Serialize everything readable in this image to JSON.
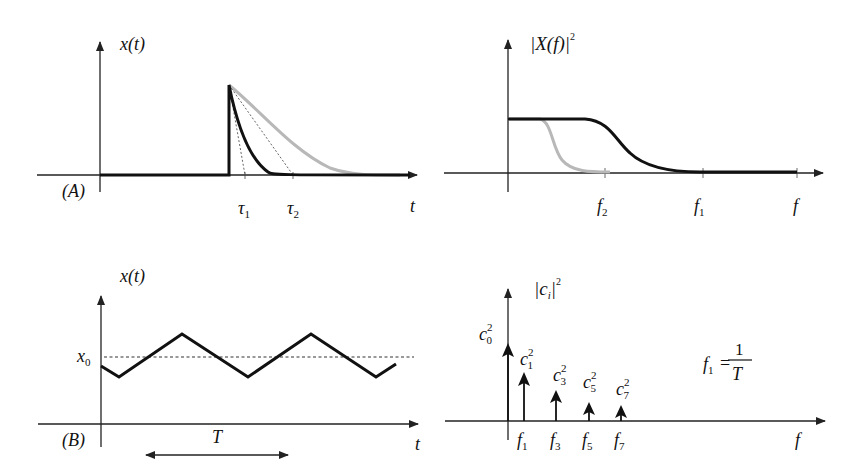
{
  "panels": {
    "A_time": {
      "panel_label": "(A)",
      "y_label": "x(t)",
      "x_label": "t",
      "tick_labels": [
        "τ1",
        "τ2"
      ],
      "tau1": "τ",
      "tau1_sub": "1",
      "tau2": "τ",
      "tau2_sub": "2"
    },
    "A_freq": {
      "y_label_main": "|X(f)|",
      "y_label_sup": "2",
      "x_label": "f",
      "f2": "f",
      "f2_sub": "2",
      "f1": "f",
      "f1_sub": "1"
    },
    "B_time": {
      "panel_label": "(B)",
      "y_label": "x(t)",
      "x_label": "t",
      "level_label": "x",
      "level_sub": "0",
      "period_label": "T"
    },
    "B_freq": {
      "y_label_main": "|c",
      "y_label_sub": "i",
      "y_label_close": "|",
      "y_label_sup": "2",
      "x_label": "f",
      "coeffs": [
        {
          "c": "c",
          "sub": "0",
          "sup": "2"
        },
        {
          "c": "c",
          "sub": "1",
          "sup": "2"
        },
        {
          "c": "c",
          "sub": "3",
          "sup": "2"
        },
        {
          "c": "c",
          "sub": "5",
          "sup": "2"
        },
        {
          "c": "c",
          "sub": "7",
          "sup": "2"
        }
      ],
      "freqs": [
        {
          "f": "f",
          "sub": "1"
        },
        {
          "f": "f",
          "sub": "3"
        },
        {
          "f": "f",
          "sub": "5"
        },
        {
          "f": "f",
          "sub": "7"
        }
      ],
      "formula": {
        "lhs": "f",
        "lhs_sub": "1",
        "eq": "=",
        "num": "1",
        "den": "T"
      }
    }
  },
  "colors": {
    "primary_curve": "#111111",
    "secondary_curve": "#b8b8b8",
    "axis": "#222222"
  }
}
